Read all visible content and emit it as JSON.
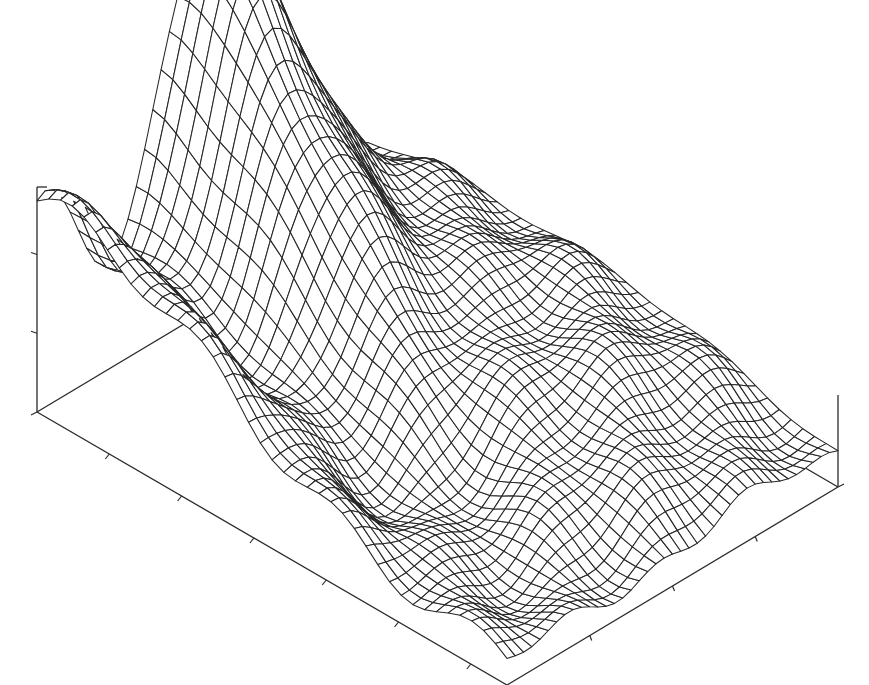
{
  "chart_data": {
    "type": "surface",
    "title": "",
    "xlabel": "",
    "ylabel": "",
    "zlabel": "",
    "style": "wireframe mesh, black lines on white",
    "grid_size": [
      40,
      40
    ],
    "axes_box": {
      "origin_back_left": [
        37,
        412
      ],
      "front_corner": [
        507,
        685
      ],
      "right_corner": [
        838,
        487
      ],
      "vertical_axis_top": [
        37,
        187
      ],
      "right_vertical_top": [
        838,
        395
      ]
    },
    "z_ticks_count": 3,
    "x_ticks_count": 6,
    "y_ticks_count": 3,
    "features": [
      {
        "name": "main peak",
        "location": "back center",
        "relative_height": 1.0,
        "screen_apex": [
          368,
          30
        ]
      },
      {
        "name": "left ridge",
        "location": "back-left edge",
        "relative_height": 0.62
      },
      {
        "name": "middle hump",
        "location": "center",
        "relative_height": 0.45
      },
      {
        "name": "right plateau",
        "location": "right edge",
        "relative_height": 0.3
      },
      {
        "name": "valley",
        "location": "front-left",
        "relative_height": 0.05
      }
    ],
    "legend": []
  }
}
